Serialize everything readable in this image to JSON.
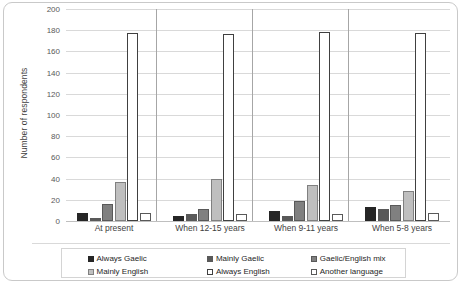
{
  "chart_data": {
    "type": "bar",
    "title": "",
    "xlabel": "",
    "ylabel": "Number of respondents",
    "ylim": [
      0,
      200
    ],
    "yticks": [
      0,
      20,
      40,
      60,
      80,
      100,
      120,
      140,
      160,
      180,
      200
    ],
    "grid": true,
    "legend_position": "bottom",
    "categories": [
      "At present",
      "When 12-15 years",
      "When 9-11 years",
      "When 5-8 years"
    ],
    "series": [
      {
        "name": "Always Gaelic",
        "color": "#262626",
        "outline": "#262626",
        "values": [
          8,
          5,
          9,
          13
        ]
      },
      {
        "name": "Mainly Gaelic",
        "color": "#595959",
        "outline": "#595959",
        "values": [
          3,
          7,
          5,
          11
        ]
      },
      {
        "name": "Gaelic/English mix",
        "color": "#808080",
        "outline": "#595959",
        "values": [
          16,
          11,
          19,
          15
        ]
      },
      {
        "name": "Mainly English",
        "color": "#bfbfbf",
        "outline": "#808080",
        "values": [
          37,
          40,
          34,
          28
        ]
      },
      {
        "name": "Always English",
        "color": "#ffffff",
        "outline": "#404040",
        "values": [
          177,
          176,
          178,
          177
        ]
      },
      {
        "name": "Another language",
        "color": "#ffffff",
        "outline": "#595959",
        "values": [
          8,
          7,
          7,
          8
        ]
      }
    ]
  }
}
